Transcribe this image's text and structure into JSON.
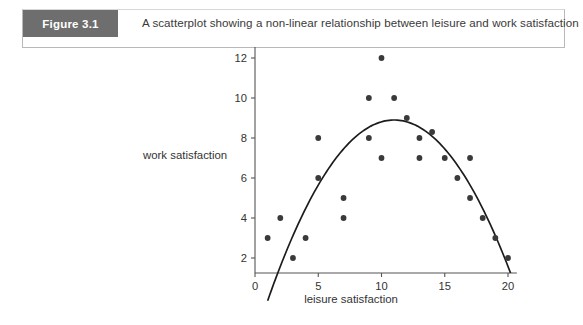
{
  "figure": {
    "label": "Figure 3.1",
    "caption": "A scatterplot showing a non-linear relationship between leisure and work satisfaction"
  },
  "colors": {
    "label_background": "#6e6e6e",
    "label_text": "#ffffff",
    "point": "#3a3a3a",
    "trend_line": "#1c1c1c",
    "axis": "#555555",
    "page_background": "#ffffff"
  },
  "chart_data": {
    "type": "scatter",
    "title": "A scatterplot showing a non-linear relationship between leisure and work satisfaction",
    "xlabel": "leisure satisfaction",
    "ylabel": "work satisfaction",
    "xlim": [
      0,
      20.8
    ],
    "ylim": [
      0.9,
      12.6
    ],
    "xticks": [
      0,
      5,
      10,
      15,
      20
    ],
    "yticks": [
      2,
      4,
      6,
      8,
      10,
      12
    ],
    "grid": false,
    "legend": null,
    "points": [
      {
        "x": 1,
        "y": 3
      },
      {
        "x": 2,
        "y": 4
      },
      {
        "x": 3,
        "y": 2
      },
      {
        "x": 4,
        "y": 3
      },
      {
        "x": 5,
        "y": 6
      },
      {
        "x": 5,
        "y": 8
      },
      {
        "x": 7,
        "y": 5
      },
      {
        "x": 7,
        "y": 4
      },
      {
        "x": 9,
        "y": 10
      },
      {
        "x": 9,
        "y": 8
      },
      {
        "x": 10,
        "y": 12
      },
      {
        "x": 10,
        "y": 7
      },
      {
        "x": 11,
        "y": 10
      },
      {
        "x": 12,
        "y": 9
      },
      {
        "x": 13,
        "y": 8
      },
      {
        "x": 13,
        "y": 7
      },
      {
        "x": 14,
        "y": 8.3
      },
      {
        "x": 15,
        "y": 7
      },
      {
        "x": 16,
        "y": 6
      },
      {
        "x": 17,
        "y": 7
      },
      {
        "x": 17,
        "y": 5
      },
      {
        "x": 18,
        "y": 4
      },
      {
        "x": 19,
        "y": 3
      },
      {
        "x": 20,
        "y": 2
      }
    ],
    "trend": {
      "type": "quadratic",
      "description": "inverted U-shaped curve peaking near x = 11",
      "vertex": {
        "x": 11,
        "y": 8.9
      },
      "x_start": 1.0,
      "x_end": 20.2
    }
  }
}
